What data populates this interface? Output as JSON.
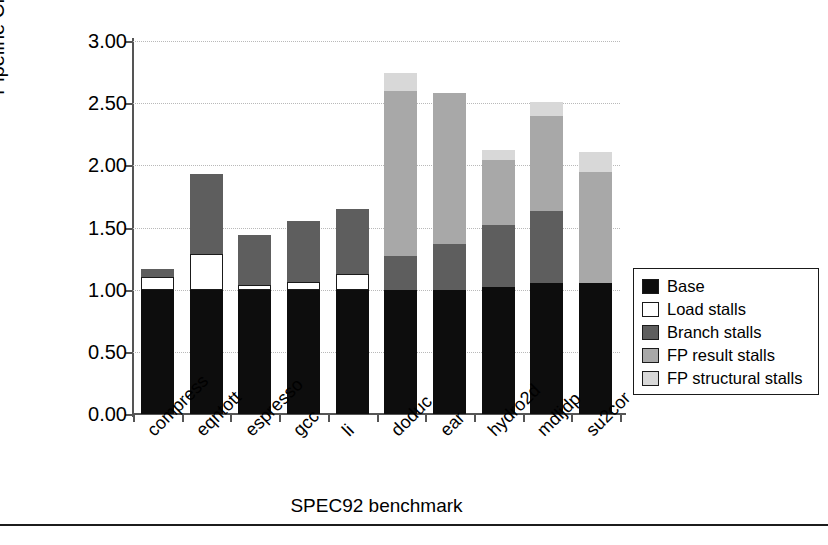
{
  "chart_data": {
    "type": "bar",
    "subtype": "stacked-bar",
    "title": "",
    "xlabel": "SPEC92 benchmark",
    "ylabel": "Pipeline CPI",
    "ylim": [
      0.0,
      3.0
    ],
    "ytick_step": 0.5,
    "ytick_labels": [
      "3.00",
      "2.50",
      "2.00",
      "1.50",
      "1.00",
      "0.50",
      "0.00"
    ],
    "ytick_values": [
      3.0,
      2.5,
      2.0,
      1.5,
      1.0,
      0.5,
      0.0
    ],
    "grid": "horizontal-dotted",
    "legend_position": "right-outside",
    "categories": [
      "compress",
      "eqntott",
      "espresso",
      "gcc",
      "li",
      "doduc",
      "ear",
      "hydro2d",
      "mdljdp",
      "su2cor"
    ],
    "series": [
      {
        "name": "Base",
        "color": "#0d0d0d",
        "values": [
          1.0,
          1.0,
          1.0,
          1.0,
          1.0,
          1.0,
          1.0,
          1.02,
          1.05,
          1.05
        ]
      },
      {
        "name": "Load stalls",
        "color": "#ffffff",
        "values": [
          0.1,
          0.29,
          0.04,
          0.06,
          0.13,
          0.0,
          0.0,
          0.0,
          0.0,
          0.0
        ]
      },
      {
        "name": "Branch stalls",
        "color": "#5e5e5e",
        "values": [
          0.07,
          0.64,
          0.4,
          0.49,
          0.52,
          0.27,
          0.37,
          0.5,
          0.58,
          0.0
        ]
      },
      {
        "name": "FP result stalls",
        "color": "#a8a8a8",
        "values": [
          0.0,
          0.0,
          0.0,
          0.0,
          0.0,
          1.33,
          1.21,
          0.52,
          0.77,
          0.9
        ]
      },
      {
        "name": "FP structural stalls",
        "color": "#d8d8d8",
        "values": [
          0.0,
          0.0,
          0.0,
          0.0,
          0.0,
          0.14,
          0.0,
          0.08,
          0.11,
          0.16
        ]
      }
    ],
    "totals": [
      1.17,
      1.93,
      1.44,
      1.55,
      1.65,
      2.74,
      2.58,
      2.12,
      2.51,
      2.11
    ]
  },
  "legend": {
    "items": [
      {
        "label": "Base",
        "color": "#0d0d0d"
      },
      {
        "label": "Load stalls",
        "color": "#ffffff"
      },
      {
        "label": "Branch stalls",
        "color": "#5e5e5e"
      },
      {
        "label": "FP result stalls",
        "color": "#a8a8a8"
      },
      {
        "label": "FP structural stalls",
        "color": "#d8d8d8"
      }
    ]
  }
}
